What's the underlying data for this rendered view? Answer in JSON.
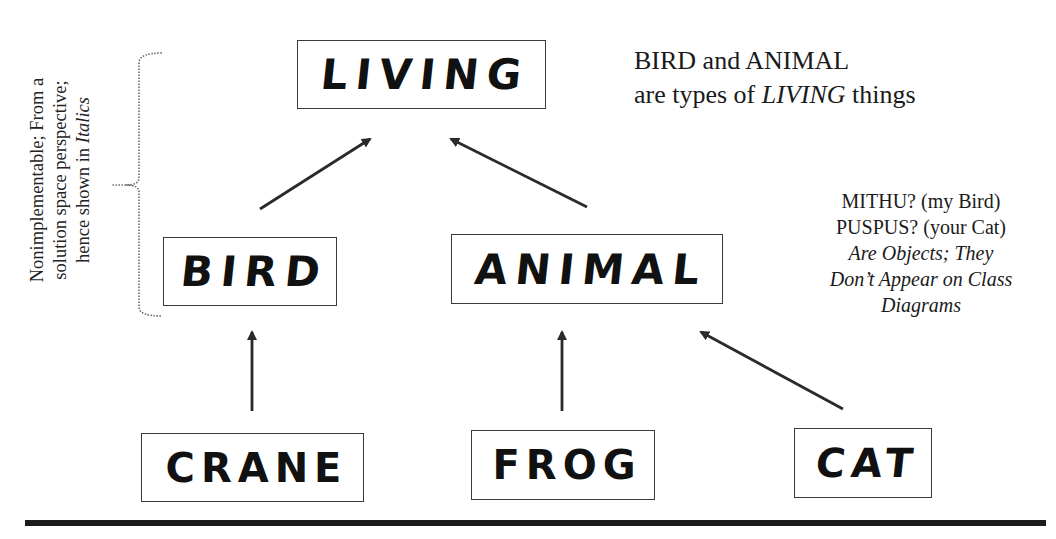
{
  "diagram": {
    "type": "class-hierarchy",
    "classes": [
      {
        "id": "living",
        "label": "LIVING",
        "level": 0
      },
      {
        "id": "bird",
        "label": "BIRD",
        "level": 1
      },
      {
        "id": "animal",
        "label": "ANIMAL",
        "level": 1
      },
      {
        "id": "crane",
        "label": "CRANE",
        "level": 2
      },
      {
        "id": "frog",
        "label": "FROG",
        "level": 2
      },
      {
        "id": "cat",
        "label": "CAT",
        "level": 2
      }
    ],
    "edges": [
      {
        "from": "bird",
        "to": "living",
        "kind": "inheritance"
      },
      {
        "from": "animal",
        "to": "living",
        "kind": "inheritance"
      },
      {
        "from": "crane",
        "to": "bird",
        "kind": "inheritance"
      },
      {
        "from": "frog",
        "to": "animal",
        "kind": "inheritance"
      },
      {
        "from": "cat",
        "to": "animal",
        "kind": "inheritance"
      }
    ]
  },
  "boxes": {
    "living": "LIVING",
    "bird": "BIRD",
    "animal": "ANIMAL",
    "crane": "CRANE",
    "frog": "FROG",
    "cat": "CAT"
  },
  "notes": {
    "top_line1": "BIRD and ANIMAL",
    "top_line2_pre": "are types of ",
    "top_line2_italic": "LIVING",
    "top_line2_post": " things",
    "right_line1": "MITHU? (my Bird)",
    "right_line2": "PUSPUS? (your Cat)",
    "right_line3": "Are Objects; They",
    "right_line4": "Don’t Appear on Class",
    "right_line5": "Diagrams",
    "side_line1": "Nonimplementable; From a",
    "side_line2": "solution space perspective;",
    "side_line3_pre": "hence shown in ",
    "side_line3_italic": "Italics"
  },
  "colors": {
    "ink": "#1c1c1c",
    "box_border": "#3a3a3a",
    "bracket": "#6a6a6a",
    "background": "#ffffff"
  }
}
